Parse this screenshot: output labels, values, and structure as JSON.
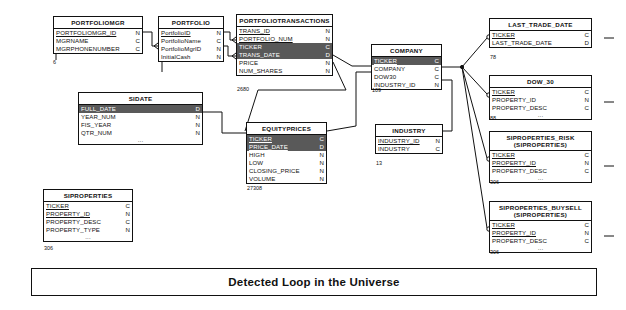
{
  "diagram": {
    "title": "Detected Loop in the Universe",
    "banner_label": "Detected Loop in the Universe",
    "tables": [
      {
        "id": "portfoliomgr",
        "name": "PORTFOLIOMGR",
        "subtitle": "",
        "row_count": "6",
        "columns": [
          {
            "name": "PORTFOLIOMGR_ID",
            "type": "N",
            "key": true,
            "highlighted": false
          },
          {
            "name": "MGRNAME",
            "type": "C",
            "key": false,
            "highlighted": false
          },
          {
            "name": "MGRPHONENUMBER",
            "type": "C",
            "key": false,
            "highlighted": false
          }
        ]
      },
      {
        "id": "portfolio",
        "name": "PORTFOLIO",
        "subtitle": "",
        "row_count": "6",
        "columns": [
          {
            "name": "PortfolioID",
            "type": "N",
            "key": true,
            "highlighted": false
          },
          {
            "name": "PortfolioName",
            "type": "C",
            "key": false,
            "highlighted": false
          },
          {
            "name": "PortfolioMgrID",
            "type": "N",
            "key": false,
            "highlighted": false
          },
          {
            "name": "InitialCash",
            "type": "N",
            "key": false,
            "highlighted": false
          }
        ]
      },
      {
        "id": "portfoliotransactions",
        "name": "PORTFOLIOTRANSACTIONS",
        "subtitle": "",
        "row_count": "2680",
        "columns": [
          {
            "name": "TRANS_ID",
            "type": "N",
            "key": true,
            "highlighted": false
          },
          {
            "name": "PORTFOLIO_NUM",
            "type": "N",
            "key": true,
            "highlighted": false
          },
          {
            "name": "TICKER",
            "type": "C",
            "key": false,
            "highlighted": true
          },
          {
            "name": "TRANS_DATE",
            "type": "D",
            "key": false,
            "highlighted": true
          },
          {
            "name": "PRICE",
            "type": "N",
            "key": false,
            "highlighted": false
          },
          {
            "name": "NUM_SHARES",
            "type": "N",
            "key": false,
            "highlighted": false
          }
        ]
      },
      {
        "id": "company",
        "name": "COMPANY",
        "subtitle": "",
        "row_count": "109",
        "columns": [
          {
            "name": "TICKER",
            "type": "C",
            "key": true,
            "highlighted": true
          },
          {
            "name": "COMPANY",
            "type": "C",
            "key": false,
            "highlighted": false
          },
          {
            "name": "DOW30",
            "type": "C",
            "key": false,
            "highlighted": false
          },
          {
            "name": "INDUSTRY_ID",
            "type": "N",
            "key": false,
            "highlighted": false
          }
        ]
      },
      {
        "id": "sidate",
        "name": "SIDATE",
        "subtitle": "",
        "row_count": "",
        "columns": [
          {
            "name": "FULL_DATE",
            "type": "D",
            "key": false,
            "highlighted": true
          },
          {
            "name": "YEAR_NUM",
            "type": "N",
            "key": false,
            "highlighted": false
          },
          {
            "name": "FIS_YEAR",
            "type": "N",
            "key": false,
            "highlighted": false
          },
          {
            "name": "QTR_NUM",
            "type": "N",
            "key": false,
            "highlighted": false
          },
          {
            "name": "...",
            "type": "",
            "key": false,
            "highlighted": false,
            "ellipsis": true
          }
        ]
      },
      {
        "id": "equityprices",
        "name": "EQUITYPRICES",
        "subtitle": "",
        "row_count": "27308",
        "columns": [
          {
            "name": "TICKER",
            "type": "C",
            "key": true,
            "highlighted": true
          },
          {
            "name": "PRICE_DATE",
            "type": "D",
            "key": true,
            "highlighted": true
          },
          {
            "name": "HIGH",
            "type": "N",
            "key": false,
            "highlighted": false
          },
          {
            "name": "LOW",
            "type": "N",
            "key": false,
            "highlighted": false
          },
          {
            "name": "CLOSING_PRICE",
            "type": "N",
            "key": false,
            "highlighted": false
          },
          {
            "name": "VOLUME",
            "type": "N",
            "key": false,
            "highlighted": false
          }
        ]
      },
      {
        "id": "industry",
        "name": "INDUSTRY",
        "subtitle": "",
        "row_count": "13",
        "columns": [
          {
            "name": "INDUSTRY_ID",
            "type": "N",
            "key": true,
            "highlighted": false
          },
          {
            "name": "INDUSTRY",
            "type": "C",
            "key": false,
            "highlighted": false
          }
        ]
      },
      {
        "id": "siproperties",
        "name": "SIPROPERTIES",
        "subtitle": "",
        "row_count": "306",
        "columns": [
          {
            "name": "TICKER",
            "type": "C",
            "key": true,
            "highlighted": false
          },
          {
            "name": "PROPERTY_ID",
            "type": "N",
            "key": true,
            "highlighted": false
          },
          {
            "name": "PROPERTY_DESC",
            "type": "C",
            "key": false,
            "highlighted": false
          },
          {
            "name": "PROPERTY_TYPE",
            "type": "N",
            "key": false,
            "highlighted": false
          },
          {
            "name": "...",
            "type": "",
            "key": false,
            "highlighted": false,
            "ellipsis": true
          }
        ]
      },
      {
        "id": "last_trade_date",
        "name": "LAST_TRADE_DATE",
        "subtitle": "",
        "row_count": "78",
        "columns": [
          {
            "name": "TICKER",
            "type": "C",
            "key": true,
            "highlighted": false
          },
          {
            "name": "LAST_TRADE_DATE",
            "type": "D",
            "key": false,
            "highlighted": false
          }
        ]
      },
      {
        "id": "dow_30",
        "name": "DOW_30",
        "subtitle": "",
        "row_count": "88",
        "columns": [
          {
            "name": "TICKER",
            "type": "C",
            "key": true,
            "highlighted": false
          },
          {
            "name": "PROPERTY_ID",
            "type": "N",
            "key": false,
            "highlighted": false
          },
          {
            "name": "PROPERTY_DESC",
            "type": "C",
            "key": false,
            "highlighted": false
          },
          {
            "name": "...",
            "type": "",
            "key": false,
            "highlighted": false,
            "ellipsis": true
          }
        ]
      },
      {
        "id": "siproperties_risk",
        "name": "SIPROPERTIES_RISK",
        "subtitle": "(SIPROPERTIES)",
        "row_count": "306",
        "columns": [
          {
            "name": "TICKER",
            "type": "C",
            "key": true,
            "highlighted": false
          },
          {
            "name": "PROPERTY_ID",
            "type": "N",
            "key": true,
            "highlighted": false
          },
          {
            "name": "PROPERTY_DESC",
            "type": "C",
            "key": false,
            "highlighted": false
          },
          {
            "name": "...",
            "type": "",
            "key": false,
            "highlighted": false,
            "ellipsis": true
          }
        ]
      },
      {
        "id": "siproperties_buysell",
        "name": "SIPROPERTIES_BUYSELL",
        "subtitle": "(SIPROPERTIES)",
        "row_count": "306",
        "columns": [
          {
            "name": "TICKER",
            "type": "C",
            "key": true,
            "highlighted": false
          },
          {
            "name": "PROPERTY_ID",
            "type": "N",
            "key": true,
            "highlighted": false
          },
          {
            "name": "PROPERTY_DESC",
            "type": "C",
            "key": false,
            "highlighted": false
          },
          {
            "name": "...",
            "type": "",
            "key": false,
            "highlighted": false,
            "ellipsis": true
          }
        ]
      }
    ],
    "colors": {
      "line": "#111111",
      "highlight_fill": "#595959",
      "highlight_text": "#ffffff",
      "table_border": "#111111",
      "background": "#ffffff"
    }
  }
}
